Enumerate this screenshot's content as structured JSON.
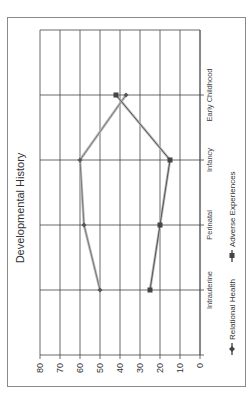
{
  "chart_data": {
    "type": "line",
    "title": "Developmental History",
    "orientation": "rotated-90-ccw",
    "categories": [
      "Intrauterine",
      "Perinatal",
      "Infancy",
      "Early Childhood"
    ],
    "series": [
      {
        "name": "Relational Health",
        "values": [
          50,
          58,
          60,
          37
        ],
        "color": "#7a7a7a",
        "marker": "diamond"
      },
      {
        "name": "Adverse Experiences",
        "values": [
          25,
          20,
          15,
          42
        ],
        "color": "#555555",
        "marker": "square"
      }
    ],
    "yticks": [
      "0",
      "10",
      "20",
      "30",
      "40",
      "50",
      "60",
      "70",
      "80"
    ],
    "ylim": [
      0,
      80
    ],
    "xlabel": "",
    "ylabel": "",
    "grid": true,
    "legend_position": "bottom"
  },
  "legend": {
    "items": [
      "Relational Health",
      "Adverse Experiences"
    ]
  }
}
